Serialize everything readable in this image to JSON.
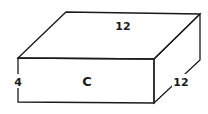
{
  "diagram": {
    "type": "rectangular-prism",
    "labels": {
      "top_depth": "12",
      "right_width": "12",
      "left_height": "4",
      "front_face": "C"
    },
    "colors": {
      "stroke": "#1a1a1a",
      "background": "#ffffff"
    }
  }
}
